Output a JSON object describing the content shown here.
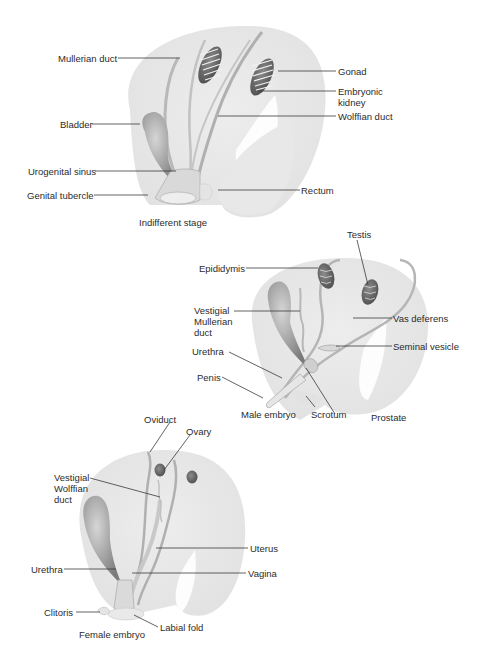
{
  "diagrams": {
    "indifferent": {
      "caption": "Indifferent stage",
      "labels": {
        "mullerian_duct": "Mullerian duct",
        "gonad": "Gonad",
        "embryonic_kidney_1": "Embryonic",
        "embryonic_kidney_2": "kidney",
        "wolffian_duct": "Wolffian duct",
        "bladder": "Bladder",
        "urogenital_sinus": "Urogenital sinus",
        "genital_tubercle": "Genital tubercle",
        "rectum": "Rectum"
      }
    },
    "male": {
      "caption": "Male embryo",
      "labels": {
        "testis": "Testis",
        "epididymis": "Epididymis",
        "vestigial_mullerian_1": "Vestigial",
        "vestigial_mullerian_2": "Mullerian",
        "vestigial_mullerian_3": "duct",
        "vas_deferens": "Vas deferens",
        "seminal_vesicle": "Seminal vesicle",
        "urethra": "Urethra",
        "penis": "Penis",
        "scrotum": "Scrotum",
        "prostate": "Prostate"
      }
    },
    "female": {
      "caption": "Female embryo",
      "labels": {
        "oviduct": "Oviduct",
        "ovary": "Ovary",
        "vestigial_wolffian_1": "Vestigial",
        "vestigial_wolffian_2": "Wolffian",
        "vestigial_wolffian_3": "duct",
        "uterus": "Uterus",
        "urethra": "Urethra",
        "vagina": "Vagina",
        "clitoris": "Clitoris",
        "labial_fold": "Labial fold"
      }
    }
  },
  "colors": {
    "body_fill": "#ececec",
    "organ_dark": "#6b6b6b",
    "duct_stroke": "#b5b5b5",
    "leader_line": "#3a3a3a"
  }
}
